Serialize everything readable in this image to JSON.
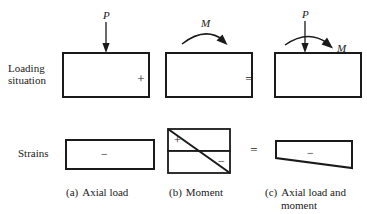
{
  "figure": {
    "rows": [
      {
        "label": "Loading\nsituation"
      },
      {
        "label": "Strains"
      }
    ],
    "operators": {
      "plus": "+",
      "equals": "="
    },
    "load_symbols": {
      "axial_force": "P",
      "moment": "M"
    },
    "strain_signs": {
      "compression": "−",
      "tension": "+"
    },
    "columns": [
      {
        "tag": "(a)",
        "caption": "Axial load",
        "loading": {
          "member": "rectangular-member",
          "arrows": [
            "downward-axial-force-arrow"
          ],
          "symbols": [
            "P"
          ]
        },
        "strain": {
          "shape": "uniform-rectangle",
          "signs": [
            "−"
          ]
        }
      },
      {
        "tag": "(b)",
        "caption": "Moment",
        "loading": {
          "member": "rectangular-member",
          "arrows": [
            "clockwise-moment-arc-arrow"
          ],
          "symbols": [
            "M"
          ]
        },
        "strain": {
          "shape": "linear-bending-bowtie",
          "signs": [
            "+",
            "−"
          ]
        }
      },
      {
        "tag": "(c)",
        "caption": "Axial load and moment",
        "caption_line1": "Axial load and",
        "caption_line2": "moment",
        "loading": {
          "member": "rectangular-member",
          "arrows": [
            "downward-axial-force-arrow",
            "clockwise-moment-arc-arrow"
          ],
          "symbols": [
            "P",
            "M"
          ]
        },
        "strain": {
          "shape": "trapezoid-combined",
          "signs": [
            "−"
          ]
        }
      }
    ],
    "colors": {
      "ink": "#1a1a1a",
      "background": "#ffffff"
    }
  }
}
